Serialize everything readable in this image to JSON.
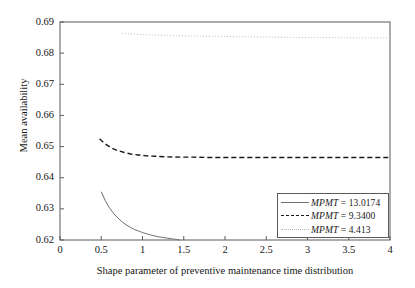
{
  "chart_data": {
    "type": "line",
    "title": "",
    "xlabel": "Shape parameter of preventive maintenance time distribution",
    "ylabel": "Mean availability",
    "xlim": [
      0,
      4
    ],
    "ylim": [
      0.62,
      0.69
    ],
    "grid": false,
    "legend_position": "lower right",
    "xticks": [
      "0",
      "0.5",
      "1",
      "1.5",
      "2",
      "2.5",
      "3",
      "3.5",
      "4"
    ],
    "xtick_values": [
      0,
      0.5,
      1,
      1.5,
      2,
      2.5,
      3,
      3.5,
      4
    ],
    "yticks": [
      "0.62",
      "0.63",
      "0.64",
      "0.65",
      "0.66",
      "0.67",
      "0.68",
      "0.69"
    ],
    "ytick_values": [
      0.62,
      0.63,
      0.64,
      0.65,
      0.66,
      0.67,
      0.68,
      0.69
    ],
    "series": [
      {
        "name": "MPMT = 13.0174",
        "label_prefix": "MPMT",
        "label_value": "13.0174",
        "style": "solid",
        "color": "#6f6f6f",
        "x": [
          0.5,
          0.55,
          0.6,
          0.65,
          0.7,
          0.75,
          0.8,
          0.85,
          0.9,
          0.95,
          1.0,
          1.05,
          1.1,
          1.15,
          1.2,
          1.25,
          1.3,
          1.35,
          1.4,
          1.45
        ],
        "y": [
          0.6355,
          0.6326,
          0.6303,
          0.6285,
          0.6271,
          0.6259,
          0.6249,
          0.6241,
          0.6234,
          0.6229,
          0.6224,
          0.622,
          0.6216,
          0.6213,
          0.621,
          0.6208,
          0.6206,
          0.6204,
          0.6202,
          0.62
        ]
      },
      {
        "name": "MPMT = 9.3400",
        "label_prefix": "MPMT",
        "label_value": "9.3400",
        "style": "dashed",
        "color": "#1a1a1a",
        "x": [
          0.48,
          0.55,
          0.62,
          0.7,
          0.78,
          0.86,
          0.95,
          1.05,
          1.15,
          1.3,
          1.45,
          1.6,
          1.8,
          2.0,
          2.25,
          2.5,
          2.8,
          3.1,
          3.4,
          3.7,
          4.0
        ],
        "y": [
          0.6525,
          0.6508,
          0.6496,
          0.6487,
          0.6481,
          0.6476,
          0.6473,
          0.647,
          0.6469,
          0.6467,
          0.6466,
          0.6466,
          0.6465,
          0.6465,
          0.6465,
          0.6465,
          0.6465,
          0.6465,
          0.6465,
          0.6465,
          0.6465
        ]
      },
      {
        "name": "MPMT = 4.413",
        "label_prefix": "MPMT",
        "label_value": "4.413",
        "style": "dotted",
        "color": "#b9b9b9",
        "x": [
          0.75,
          0.9,
          1.05,
          1.2,
          1.4,
          1.6,
          1.85,
          2.1,
          2.4,
          2.7,
          3.0,
          3.3,
          3.6,
          3.9,
          4.0
        ],
        "y": [
          0.6864,
          0.6861,
          0.6859,
          0.6858,
          0.6856,
          0.6855,
          0.6854,
          0.6853,
          0.6852,
          0.6851,
          0.685,
          0.685,
          0.6849,
          0.6849,
          0.6849
        ]
      }
    ]
  },
  "legend": {
    "rows": [
      {
        "text": "MPMT = 13.0174",
        "prefix": "MPMT",
        "rest": " = 13.0174"
      },
      {
        "text": "MPMT = 9.3400",
        "prefix": "MPMT",
        "rest": " = 9.3400"
      },
      {
        "text": "MPMT = 4.413",
        "prefix": "MPMT",
        "rest": " = 4.413"
      }
    ]
  }
}
